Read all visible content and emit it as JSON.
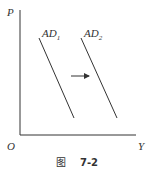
{
  "diagram": {
    "y_axis_label": "P",
    "x_axis_label": "Y",
    "origin_label": "O",
    "curves": [
      {
        "name": "AD",
        "subscript": "1"
      },
      {
        "name": "AD",
        "subscript": "2"
      }
    ],
    "arrow_direction": "right",
    "caption": {
      "prefix": "图",
      "number": "7-2"
    },
    "colors": {
      "line": "#333333",
      "background": "#ffffff"
    }
  }
}
